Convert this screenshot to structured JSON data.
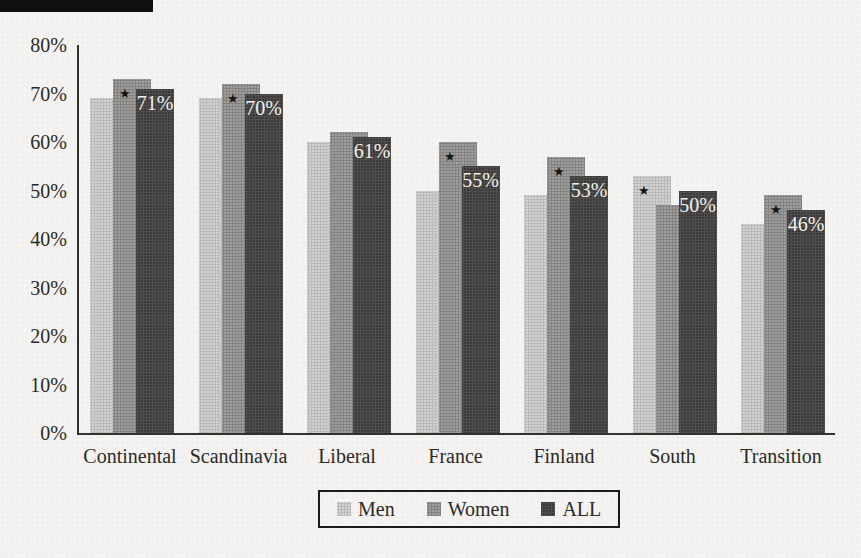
{
  "figure": {
    "background": "#f4f3f1",
    "axis_color": "#33312e",
    "text_color": "#2b2a27",
    "scan_artifact_bar": true
  },
  "chart_data": {
    "type": "bar",
    "title": "",
    "xlabel": "",
    "ylabel": "",
    "categories": [
      "Continental",
      "Scandinavia",
      "Liberal",
      "France",
      "Finland",
      "South",
      "Transition"
    ],
    "series": [
      {
        "name": "Men",
        "color": "#d4d3d1",
        "values": [
          69,
          69,
          60,
          50,
          49,
          53,
          43
        ]
      },
      {
        "name": "Women",
        "color": "#a09f9d",
        "values": [
          73,
          72,
          62,
          60,
          57,
          47,
          49
        ]
      },
      {
        "name": "ALL",
        "color": "#3b3a38",
        "values": [
          71,
          70,
          61,
          55,
          53,
          50,
          46
        ]
      }
    ],
    "bar_value_labels": {
      "series": "ALL",
      "labels": [
        "71%",
        "70%",
        "61%",
        "55%",
        "53%",
        "50%",
        "46%"
      ]
    },
    "significance_markers": {
      "glyph": "★",
      "per_category_series": [
        "Women",
        "Women",
        null,
        "Women",
        "Women",
        "Men",
        "Women"
      ]
    },
    "y_axis": {
      "min": 0,
      "max": 80,
      "tick_labels": [
        "0%",
        "10%",
        "20%",
        "30%",
        "40%",
        "50%",
        "60%",
        "70%",
        "80%"
      ]
    },
    "grid": false,
    "legend": {
      "position": "bottom-center",
      "entries": [
        "Men",
        "Women",
        "ALL"
      ]
    },
    "bar_overlap": true
  }
}
